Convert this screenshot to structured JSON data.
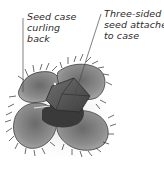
{
  "diagram": {
    "labels": [
      {
        "id": "seed-case-curling",
        "lines": [
          "Seed case",
          "curling",
          "back"
        ]
      },
      {
        "id": "three-sided-seed",
        "lines": [
          "Three-sided",
          "seed attache",
          "to case"
        ]
      }
    ],
    "colors": {
      "background": "#ffffff",
      "text": "#2b2b2b",
      "leader_line": "#4a4a4a",
      "case_light": "#8e8e8e",
      "case_dark": "#4a4a4a",
      "seed": "#5c5c5c"
    }
  }
}
